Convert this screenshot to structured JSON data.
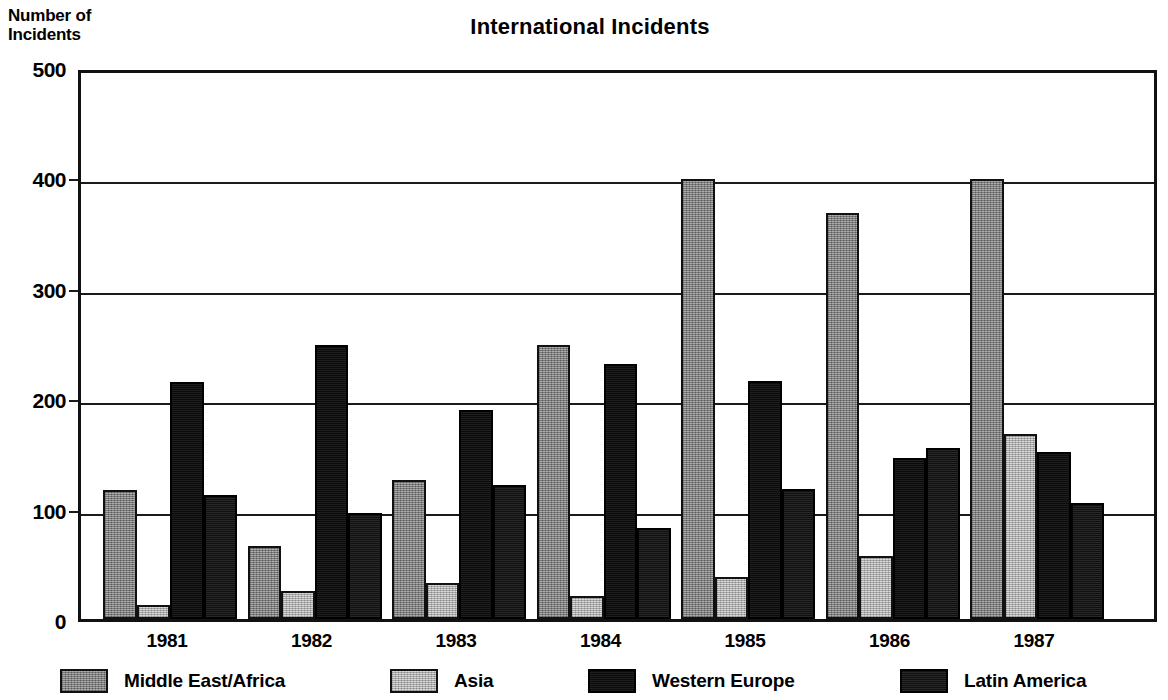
{
  "chart_data": {
    "type": "bar",
    "title": "International Incidents",
    "xlabel": "",
    "ylabel": "Number of\nIncidents",
    "categories": [
      "1981",
      "1982",
      "1983",
      "1984",
      "1985",
      "1986",
      "1987"
    ],
    "series": [
      {
        "name": "Middle East/Africa",
        "color": "#8a8a8a",
        "values": [
          117,
          66,
          126,
          248,
          399,
          368,
          399
        ]
      },
      {
        "name": "Asia",
        "color": "#b8b8b8",
        "values": [
          13,
          25,
          33,
          21,
          38,
          57,
          168
        ]
      },
      {
        "name": "Western Europe",
        "color": "#121212",
        "values": [
          215,
          248,
          189,
          231,
          216,
          146,
          151
        ]
      },
      {
        "name": "Latin America",
        "color": "#1c1c1c",
        "values": [
          112,
          96,
          121,
          82,
          118,
          155,
          105
        ]
      }
    ],
    "ylim": [
      0,
      500
    ],
    "yticks": [
      0,
      100,
      200,
      300,
      400,
      500
    ],
    "ytick_labels": [
      "0",
      "100",
      "200",
      "300",
      "400",
      "500"
    ],
    "grid": true,
    "grid_axis": "y",
    "legend_position": "bottom",
    "bar_style": "grouped"
  },
  "axis": {
    "y_caption": "Number of\nIncidents"
  }
}
